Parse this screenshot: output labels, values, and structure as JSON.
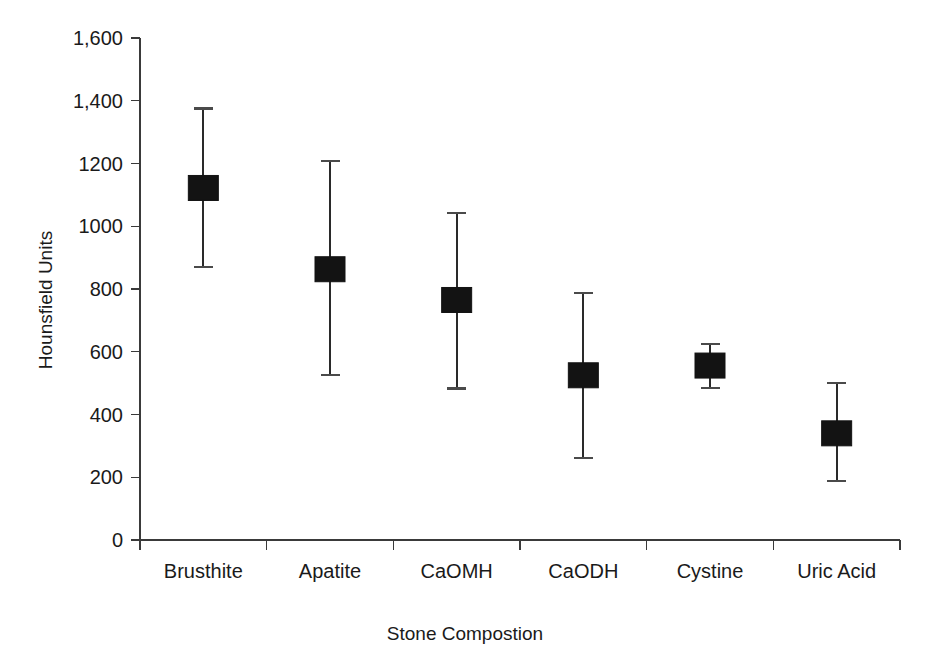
{
  "chart_data": {
    "type": "scatter",
    "title": "",
    "xlabel": "Stone Compostion",
    "ylabel": "Hounsfield Units",
    "categories": [
      "Brusthite",
      "Apatite",
      "CaOMH",
      "CaODH",
      "Cystine",
      "Uric Acid"
    ],
    "values": [
      1122,
      863,
      765,
      525,
      556,
      340
    ],
    "error_upper": [
      1375,
      1208,
      1042,
      788,
      625,
      500
    ],
    "error_lower": [
      870,
      525,
      483,
      262,
      484,
      188
    ],
    "ylim": [
      0,
      1600
    ],
    "ytick_values": [
      0,
      200,
      400,
      600,
      800,
      1000,
      1200,
      1400,
      1600
    ],
    "ytick_labels": [
      "0",
      "200",
      "400",
      "600",
      "800",
      "1000",
      "1200",
      "1,400",
      "1,600"
    ],
    "grid": false,
    "legend": "none",
    "marker": "filled-square",
    "series": [
      {
        "name": "Mean Hounsfield Units",
        "values": [
          1122,
          863,
          765,
          525,
          556,
          340
        ]
      }
    ],
    "colors": {
      "marker": "#131313",
      "errorbar": "#2a2a2a",
      "axis": "#3a3a3a",
      "background": "#ffffff",
      "text": "#1a1a1a"
    }
  },
  "axes": {
    "y_title": "Hounsfield Units",
    "x_title": "Stone Compostion"
  }
}
